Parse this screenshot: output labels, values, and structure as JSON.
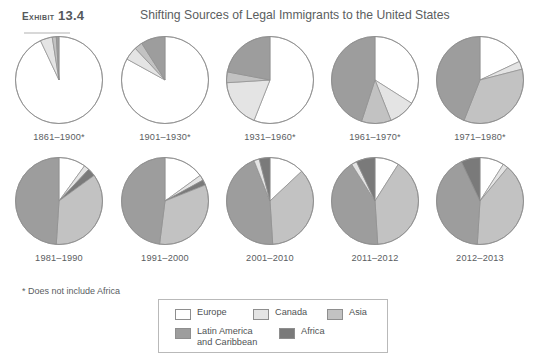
{
  "header": {
    "exhibit_word": "Exhibit",
    "exhibit_number": "13.4",
    "title": "Shifting Sources of Legal Immigrants to the United States"
  },
  "footnote": "* Does not include Africa",
  "colors": {
    "europe": "#ffffff",
    "canada": "#e4e4e4",
    "asia": "#c2c2c2",
    "latin_america": "#9d9d9d",
    "africa": "#7a7a7a",
    "outline": "#8e8e8e",
    "text": "#5a5d5f",
    "title_text": "#5b5e60",
    "legend_border": "#b9b9b9"
  },
  "legend": {
    "items": [
      {
        "label": "Europe",
        "key": "europe"
      },
      {
        "label": "Canada",
        "key": "canada"
      },
      {
        "label": "Asia",
        "key": "asia"
      },
      {
        "label": "Latin America\nand Caribbean",
        "key": "latin_america"
      },
      {
        "label": "Africa",
        "key": "africa"
      }
    ]
  },
  "chart_data": {
    "type": "pie",
    "title": "Shifting Sources of Legal Immigrants to the United States",
    "note": "* Does not include Africa",
    "categories": [
      "Europe",
      "Canada",
      "Asia",
      "Latin America and Caribbean",
      "Africa"
    ],
    "units": "percent of legal immigrants",
    "charts": [
      {
        "label": "1861–1900*",
        "slices": [
          {
            "name": "Europe",
            "value": 93.0
          },
          {
            "name": "Canada",
            "value": 4.5
          },
          {
            "name": "Asia",
            "value": 1.5
          },
          {
            "name": "Latin America and Caribbean",
            "value": 1.0
          },
          {
            "name": "Africa",
            "value": 0.0
          }
        ]
      },
      {
        "label": "1901–1930*",
        "slices": [
          {
            "name": "Europe",
            "value": 83.0
          },
          {
            "name": "Canada",
            "value": 5.0
          },
          {
            "name": "Asia",
            "value": 3.0
          },
          {
            "name": "Latin America and Caribbean",
            "value": 9.0
          },
          {
            "name": "Africa",
            "value": 0.0
          }
        ]
      },
      {
        "label": "1931–1960*",
        "slices": [
          {
            "name": "Europe",
            "value": 56.0
          },
          {
            "name": "Canada",
            "value": 18.0
          },
          {
            "name": "Asia",
            "value": 4.0
          },
          {
            "name": "Latin America and Caribbean",
            "value": 22.0
          },
          {
            "name": "Africa",
            "value": 0.0
          }
        ]
      },
      {
        "label": "1961–1970*",
        "slices": [
          {
            "name": "Europe",
            "value": 34.0
          },
          {
            "name": "Canada",
            "value": 10.0
          },
          {
            "name": "Asia",
            "value": 11.0
          },
          {
            "name": "Latin America and Caribbean",
            "value": 45.0
          },
          {
            "name": "Africa",
            "value": 0.0
          }
        ]
      },
      {
        "label": "1971–1980*",
        "slices": [
          {
            "name": "Europe",
            "value": 18.0
          },
          {
            "name": "Canada",
            "value": 3.0
          },
          {
            "name": "Asia",
            "value": 35.0
          },
          {
            "name": "Latin America and Caribbean",
            "value": 44.0
          },
          {
            "name": "Africa",
            "value": 0.0
          }
        ]
      },
      {
        "label": "1981–1990",
        "slices": [
          {
            "name": "Europe",
            "value": 10.0
          },
          {
            "name": "Canada",
            "value": 2.0
          },
          {
            "name": "Africa",
            "value": 3.0
          },
          {
            "name": "Asia",
            "value": 36.0
          },
          {
            "name": "Latin America and Caribbean",
            "value": 49.0
          }
        ]
      },
      {
        "label": "1991–2000",
        "slices": [
          {
            "name": "Europe",
            "value": 15.0
          },
          {
            "name": "Canada",
            "value": 2.0
          },
          {
            "name": "Africa",
            "value": 2.0
          },
          {
            "name": "Asia",
            "value": 33.0
          },
          {
            "name": "Latin America and Caribbean",
            "value": 48.0
          }
        ]
      },
      {
        "label": "2001–2010",
        "slices": [
          {
            "name": "Europe",
            "value": 13.0
          },
          {
            "name": "Asia",
            "value": 36.0
          },
          {
            "name": "Latin America and Caribbean",
            "value": 45.0
          },
          {
            "name": "Canada",
            "value": 2.0
          },
          {
            "name": "Africa",
            "value": 4.0
          }
        ]
      },
      {
        "label": "2011–2012",
        "slices": [
          {
            "name": "Europe",
            "value": 9.0
          },
          {
            "name": "Asia",
            "value": 40.0
          },
          {
            "name": "Latin America and Caribbean",
            "value": 42.0
          },
          {
            "name": "Canada",
            "value": 2.0
          },
          {
            "name": "Africa",
            "value": 7.0
          }
        ]
      },
      {
        "label": "2012–2013",
        "slices": [
          {
            "name": "Europe",
            "value": 9.0
          },
          {
            "name": "Canada",
            "value": 2.0
          },
          {
            "name": "Asia",
            "value": 40.0
          },
          {
            "name": "Latin America and Caribbean",
            "value": 42.0
          },
          {
            "name": "Africa",
            "value": 7.0
          }
        ]
      }
    ]
  }
}
